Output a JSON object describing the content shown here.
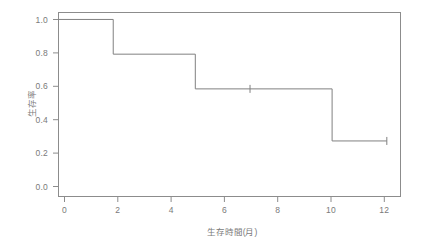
{
  "chart_data": {
    "type": "line",
    "subtype": "kaplan-meier-step",
    "title": "",
    "xlabel": "生存時間(月)",
    "ylabel": "生存率",
    "xlim": [
      0,
      12.5
    ],
    "ylim": [
      -0.02,
      1.04
    ],
    "grid": false,
    "legend": null,
    "x_ticks": [
      0,
      2,
      4,
      6,
      8,
      10,
      12
    ],
    "x_tick_labels": [
      "0",
      "2",
      "4",
      "6",
      "8",
      "10",
      "12"
    ],
    "y_ticks": [
      0.0,
      0.2,
      0.4,
      0.6,
      0.8,
      1.0
    ],
    "y_tick_labels": [
      "0.0",
      "0.2",
      "0.4",
      "0.6",
      "0.8",
      "1.0"
    ],
    "series": [
      {
        "name": "survival",
        "step": "post",
        "color": "#808080",
        "points": [
          {
            "x": 0,
            "y": 1.0
          },
          {
            "x": 2,
            "y": 1.0
          },
          {
            "x": 2,
            "y": 0.8
          },
          {
            "x": 5,
            "y": 0.8
          },
          {
            "x": 5,
            "y": 0.6
          },
          {
            "x": 10,
            "y": 0.6
          },
          {
            "x": 10,
            "y": 0.3
          },
          {
            "x": 12,
            "y": 0.3
          }
        ]
      }
    ],
    "censored_marks": [
      {
        "x": 7,
        "y": 0.6,
        "symbol": "+"
      },
      {
        "x": 12,
        "y": 0.3,
        "symbol": "+"
      }
    ],
    "events": [
      {
        "time": 2,
        "survival_before": 1.0,
        "survival_after": 0.8
      },
      {
        "time": 5,
        "survival_before": 0.8,
        "survival_after": 0.6
      },
      {
        "time": 10,
        "survival_before": 0.6,
        "survival_after": 0.3
      }
    ],
    "style": {
      "line_color": "#808080",
      "box_color": "#8c8c8c",
      "tick_color": "#8c8c8c",
      "text_color": "#7a7a7a",
      "background": "#ffffff",
      "line_width": 1
    }
  }
}
